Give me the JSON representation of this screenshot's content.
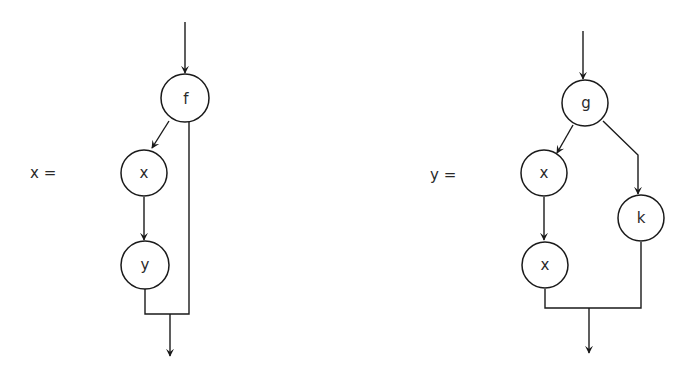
{
  "diagrams": [
    {
      "label": "x =",
      "nodes": [
        {
          "id": "f",
          "label": "f"
        },
        {
          "id": "x",
          "label": "x"
        },
        {
          "id": "y",
          "label": "y"
        }
      ],
      "edges": [
        {
          "from": "input",
          "to": "f"
        },
        {
          "from": "f",
          "to": "x"
        },
        {
          "from": "x",
          "to": "y"
        },
        {
          "from": "y",
          "to": "output"
        },
        {
          "from": "f",
          "to": "output"
        }
      ]
    },
    {
      "label": "y =",
      "nodes": [
        {
          "id": "g",
          "label": "g"
        },
        {
          "id": "x1",
          "label": "x"
        },
        {
          "id": "x2",
          "label": "x"
        },
        {
          "id": "k",
          "label": "k"
        }
      ],
      "edges": [
        {
          "from": "input",
          "to": "g"
        },
        {
          "from": "g",
          "to": "x1"
        },
        {
          "from": "g",
          "to": "k"
        },
        {
          "from": "x1",
          "to": "x2"
        },
        {
          "from": "x2",
          "to": "output"
        },
        {
          "from": "k",
          "to": "output"
        }
      ]
    }
  ]
}
